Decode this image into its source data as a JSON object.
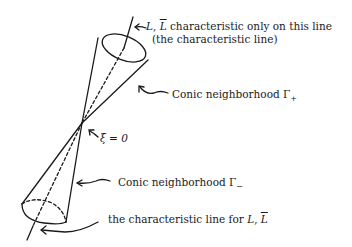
{
  "figure": {
    "labels": {
      "top_line1_prefix": "L, ",
      "top_line1_L": "L",
      "top_line1_L_bar": "L",
      "top_line1_suffix": " characteristic only on this line",
      "top_line2": "(the characteristic line)",
      "conic_plus": "Conic neighborhood Γ",
      "conic_plus_sub": "+",
      "xi": "ξ = 0",
      "conic_minus": "Conic neighborhood Γ",
      "conic_minus_sub": "−",
      "bottom_prefix": "the characteristic line for ",
      "bottom_L": "L",
      "bottom_sep": ", ",
      "bottom_L_bar": "L"
    }
  }
}
